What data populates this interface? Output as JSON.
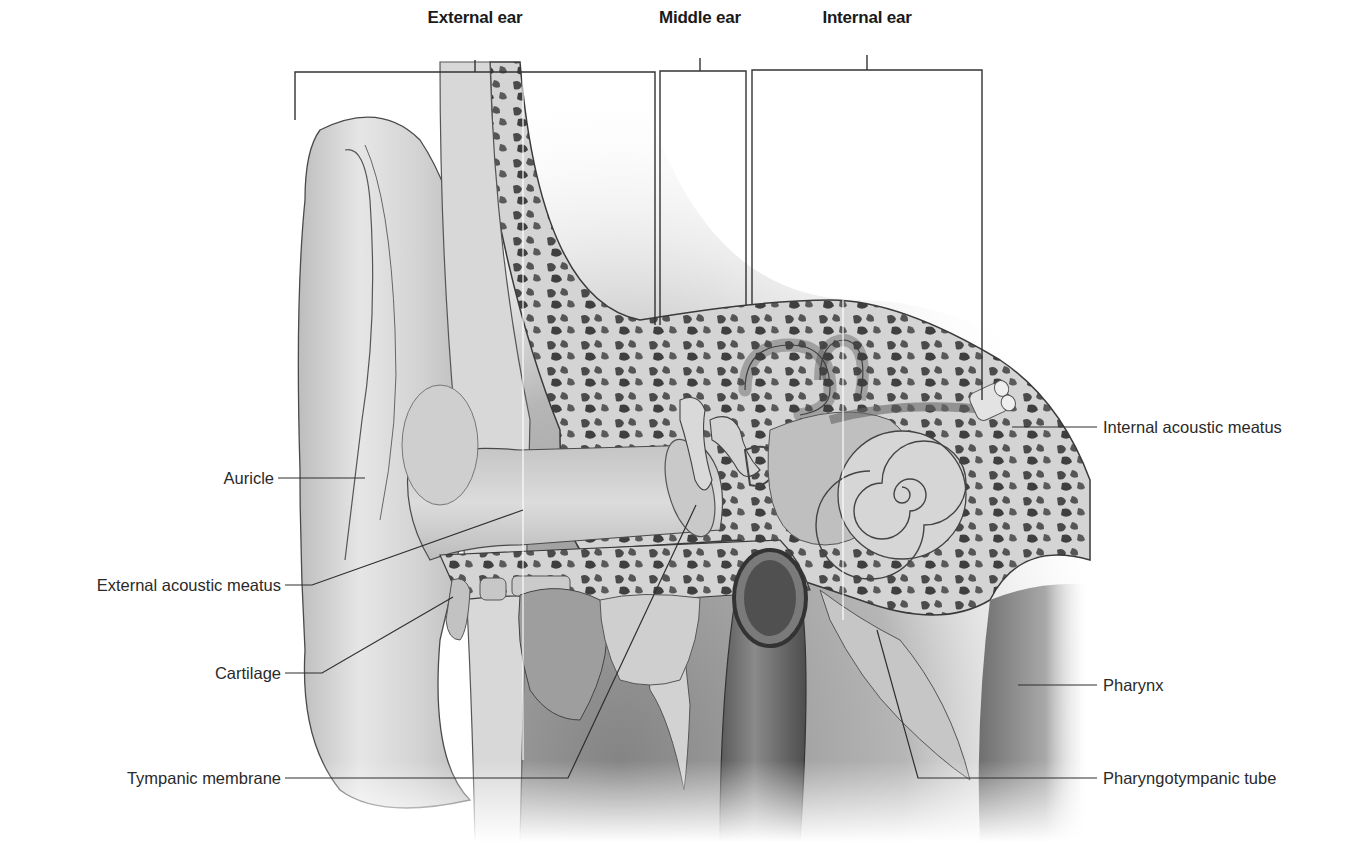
{
  "figure": {
    "colors": {
      "background": "#ffffff",
      "label_text": "#2a2a2a",
      "title_text": "#1a1a1a",
      "leader_line": "#333333",
      "skin": "#d9d9d9",
      "bone": "#cfcfcf",
      "bone_pore": "#4a4a4a",
      "shadow": "#7a7a7a"
    }
  },
  "regions": [
    {
      "id": "external",
      "title": "External ear"
    },
    {
      "id": "middle",
      "title": "Middle ear"
    },
    {
      "id": "internal",
      "title": "Internal ear"
    }
  ],
  "labels": {
    "left": [
      {
        "id": "auricle",
        "text": "Auricle"
      },
      {
        "id": "external-acoustic-meatus",
        "text": "External acoustic meatus"
      },
      {
        "id": "cartilage",
        "text": "Cartilage"
      },
      {
        "id": "tympanic-membrane",
        "text": "Tympanic membrane"
      }
    ],
    "right": [
      {
        "id": "internal-acoustic-meatus",
        "text": "Internal acoustic meatus"
      },
      {
        "id": "pharynx",
        "text": "Pharynx"
      },
      {
        "id": "pharyngotympanic-tube",
        "text": "Pharyngotympanic tube"
      }
    ]
  }
}
